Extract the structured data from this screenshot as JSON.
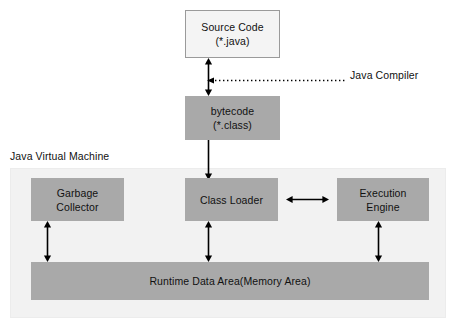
{
  "diagram": {
    "container": {
      "label": "Java Virtual Machine",
      "fill": "#f2f2f2"
    },
    "colors": {
      "box_gray": "#a9a9a9",
      "box_light": "#f4f4f4",
      "border_light": "#9a9a9a",
      "text": "#111111",
      "arrow": "#000000",
      "canvas": "#ffffff"
    },
    "nodes": [
      {
        "id": "source-code",
        "line1": "Source Code",
        "line2": "(*.java)",
        "style": "light"
      },
      {
        "id": "bytecode",
        "line1": "bytecode",
        "line2": "(*.class)",
        "style": "gray"
      },
      {
        "id": "garbage-collector",
        "line1": "Garbage",
        "line2": "Collector",
        "style": "gray"
      },
      {
        "id": "class-loader",
        "line1": "Class Loader",
        "line2": "",
        "style": "gray"
      },
      {
        "id": "execution-engine",
        "line1": "Execution",
        "line2": "Engine",
        "style": "gray"
      },
      {
        "id": "runtime-data-area",
        "line1": "Runtime Data Area(Memory Area)",
        "line2": "",
        "style": "gray"
      }
    ],
    "annotations": [
      {
        "id": "java-compiler",
        "label": "Java Compiler",
        "connector": "dotted-arrow-left"
      }
    ],
    "edges": [
      {
        "id": "source-to-bytecode",
        "from": "source-code",
        "to": "bytecode",
        "kind": "double-vertical"
      },
      {
        "id": "bytecode-to-class-loader",
        "from": "bytecode",
        "to": "class-loader",
        "kind": "single-down"
      },
      {
        "id": "class-loader-to-execution-engine",
        "from": "class-loader",
        "to": "execution-engine",
        "kind": "double-horizontal"
      },
      {
        "id": "garbage-collector-to-runtime",
        "from": "garbage-collector",
        "to": "runtime-data-area",
        "kind": "double-vertical"
      },
      {
        "id": "class-loader-to-runtime",
        "from": "class-loader",
        "to": "runtime-data-area",
        "kind": "double-vertical"
      },
      {
        "id": "execution-engine-to-runtime",
        "from": "execution-engine",
        "to": "runtime-data-area",
        "kind": "double-vertical"
      }
    ]
  }
}
